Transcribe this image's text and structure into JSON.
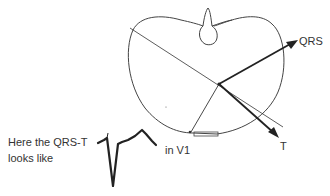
{
  "diagram": {
    "vectors": {
      "qrs_label": "QRS",
      "t_label": "T"
    },
    "caption": {
      "line1": "Here the QRS-T",
      "line2": "looks like",
      "lead": "in V1"
    },
    "colors": {
      "ink": "#2a2a2a",
      "background": "#ffffff"
    }
  }
}
